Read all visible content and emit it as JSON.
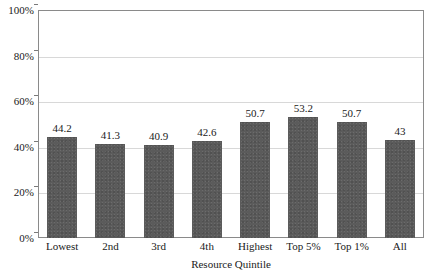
{
  "chart_data": {
    "type": "bar",
    "title": "",
    "xlabel": "Resource Quintile",
    "ylabel": "",
    "categories": [
      "Lowest",
      "2nd",
      "3rd",
      "4th",
      "Highest",
      "Top 5%",
      "Top 1%",
      "All"
    ],
    "values": [
      44.2,
      41.3,
      40.9,
      42.6,
      50.7,
      53.2,
      50.7,
      43
    ],
    "value_labels": [
      "44.2",
      "41.3",
      "40.9",
      "42.6",
      "50.7",
      "53.2",
      "50.7",
      "43"
    ],
    "ylim": [
      0,
      100
    ],
    "ytick_values": [
      0,
      20,
      40,
      60,
      80,
      100
    ],
    "ytick_labels": [
      "0%",
      "20%",
      "40%",
      "60%",
      "80%",
      "100%"
    ],
    "grid": true,
    "legend": null,
    "legend_position": "none",
    "bar_color": "#5b5b5b",
    "grid_color": "#d8d8d8",
    "frame_color": "#8a8a8a",
    "text_color": "#1a1a1a",
    "background": "#ffffff"
  }
}
